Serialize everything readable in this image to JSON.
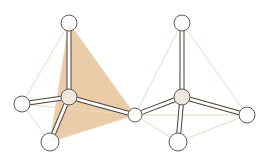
{
  "diagram": {
    "title": "",
    "type": "molecular-ball-and-stick",
    "colors": {
      "background": "#ffffff",
      "face_fill": "#e9c9a3",
      "edge_line": "#e8dcc4",
      "bond_outline": "#4a4038",
      "bond_fill": "#ffffff",
      "atom_outline": "#5a5a5a",
      "atom_fill": "#ffffff",
      "central_atom_fill": "#efe6dc"
    },
    "molecules": [
      {
        "name": "left-tetrahedron",
        "center": {
          "id": "c1",
          "x": 69,
          "y": 97,
          "r": 8
        },
        "ligands": [
          {
            "id": "l1-top",
            "x": 69,
            "y": 23,
            "r": 8
          },
          {
            "id": "l1-left",
            "x": 22,
            "y": 104,
            "r": 8
          },
          {
            "id": "l1-bottom",
            "x": 50,
            "y": 142,
            "r": 9
          },
          {
            "id": "shared",
            "x": 135,
            "y": 115,
            "r": 7
          }
        ],
        "shaded_face": [
          "l1-top",
          "l1-bottom",
          "shared"
        ]
      },
      {
        "name": "right-tetrahedron",
        "center": {
          "id": "c2",
          "x": 182,
          "y": 97,
          "r": 8
        },
        "ligands": [
          {
            "id": "l2-top",
            "x": 182,
            "y": 23,
            "r": 8
          },
          {
            "id": "shared",
            "x": 135,
            "y": 115,
            "r": 7
          },
          {
            "id": "l2-right",
            "x": 247,
            "y": 115,
            "r": 8
          },
          {
            "id": "l2-bottom",
            "x": 178,
            "y": 142,
            "r": 9
          }
        ],
        "shaded_face": []
      }
    ],
    "labels": []
  }
}
